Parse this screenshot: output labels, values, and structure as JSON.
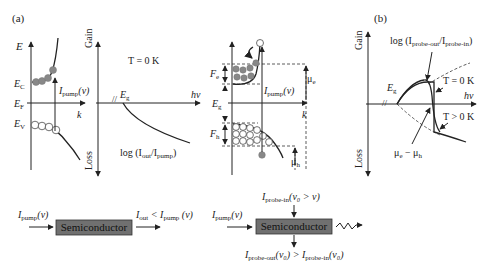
{
  "panel_a": {
    "label": "(a)",
    "band_diagram": {
      "y_axis": "E",
      "x_axis": "k",
      "levels": {
        "conduction": "E",
        "conduction_sub": "C",
        "fermi": "E",
        "fermi_sub": "F",
        "valence": "E",
        "valence_sub": "V"
      },
      "pump_label": "I",
      "pump_sub": "pump",
      "pump_arg": "(ν)"
    },
    "gain_plot": {
      "y_top": "Gain",
      "y_bottom": "Loss",
      "temperature": "T = 0 K",
      "eg": "E",
      "eg_sub": "g",
      "x_axis": "hν",
      "curve_label_pre": "log (I",
      "curve_label_sub1": "out",
      "curve_label_mid": "/I",
      "curve_label_sub2": "pump",
      "curve_label_post": ")"
    },
    "inverted_band": {
      "fe": "F",
      "fe_sub": "e",
      "fh": "F",
      "fh_sub": "h",
      "eg": "E",
      "eg_sub": "g",
      "mu_e": "μ",
      "mu_e_sub": "e",
      "mu_h": "μ",
      "mu_h_sub": "h",
      "x_axis": "k",
      "pump_label": "I",
      "pump_sub": "pump",
      "pump_arg": "(ν)"
    },
    "block_1": {
      "input_label": "I",
      "input_sub": "pump",
      "input_arg": "(ν)",
      "box_label": "Semiconductor",
      "output_pre": "I",
      "output_sub": "out",
      "output_mid": " < I",
      "output_sub2": "pump",
      "output_arg": " (ν)"
    },
    "block_2": {
      "input_label": "I",
      "input_sub": "pump",
      "input_arg": "(ν)",
      "top_label": "I",
      "top_sub": "probe-in",
      "top_arg": "(ν₀ > ν)",
      "box_label": "Semiconductor",
      "bottom_pre": "I",
      "bottom_sub1": "probe-out",
      "bottom_mid": "(ν₀) > I",
      "bottom_sub2": "probe-in",
      "bottom_arg": "(ν₀)"
    }
  },
  "panel_b": {
    "label": "(b)",
    "y_top": "Gain",
    "y_bottom": "Loss",
    "x_axis": "hν",
    "eg": "E",
    "eg_sub": "g",
    "curve_label_pre": "log (I",
    "curve_label_sub1": "probe-out",
    "curve_label_mid": "/I",
    "curve_label_sub2": "probe-in",
    "curve_label_post": ")",
    "t0": "T = 0 K",
    "tpos": "T > 0 K",
    "mu": "μ",
    "mu_sub1": "e",
    "mu_mid": " − μ",
    "mu_sub2": "h"
  },
  "colors": {
    "filled_state": "#888888",
    "box_fill": "#707070",
    "line": "#222222"
  }
}
